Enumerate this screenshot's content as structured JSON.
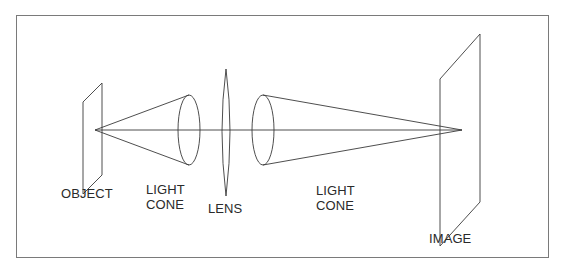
{
  "diagram": {
    "title": "",
    "stroke_color": "#3a3a3a",
    "frame_color": "#7a7a7a",
    "background": "#ffffff",
    "nodes": [
      {
        "id": "object",
        "label": "OBJECT",
        "shape": "parallelogram-plane"
      },
      {
        "id": "light_cone_1",
        "label": [
          "LIGHT",
          "CONE"
        ],
        "shape": "cone"
      },
      {
        "id": "lens",
        "label": "LENS",
        "shape": "biconvex-lens"
      },
      {
        "id": "light_cone_2",
        "label": [
          "LIGHT",
          "CONE"
        ],
        "shape": "cone"
      },
      {
        "id": "image",
        "label": "IMAGE",
        "shape": "parallelogram-plane"
      }
    ],
    "edges": [
      {
        "from": "object",
        "to": "light_cone_1",
        "type": "diverging-rays"
      },
      {
        "from": "light_cone_1",
        "to": "lens",
        "type": "optical-axis"
      },
      {
        "from": "lens",
        "to": "light_cone_2",
        "type": "optical-axis"
      },
      {
        "from": "light_cone_2",
        "to": "image",
        "type": "converging-rays"
      }
    ]
  },
  "labels": {
    "object": "OBJECT",
    "light_cone_1_line1": "LIGHT",
    "light_cone_1_line2": "CONE",
    "lens": "LENS",
    "light_cone_2_line1": "LIGHT",
    "light_cone_2_line2": "CONE",
    "image": "IMAGE"
  }
}
